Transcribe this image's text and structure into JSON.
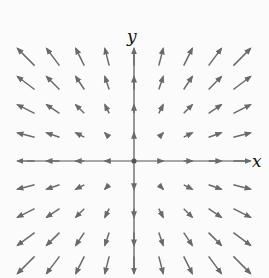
{
  "diagram": {
    "type": "vector-field",
    "field": "F(x,y) = (x, y)",
    "axes": {
      "x_label": "x",
      "y_label": "y",
      "color": "#555555"
    },
    "arrow_color": "#6a6a6a",
    "origin_px": [
      134,
      161
    ],
    "grid": {
      "i_range": [
        -4,
        4
      ],
      "j_range": [
        -4,
        4
      ],
      "spacing_x_px": 27,
      "spacing_y_px": 26,
      "scale_px_per_unit": 4.3
    }
  }
}
